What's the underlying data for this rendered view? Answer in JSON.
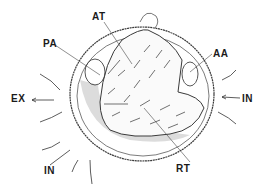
{
  "diagram": {
    "colors": {
      "line": "#3a3a3a",
      "shade": "#d8d8d8",
      "background": "#ffffff"
    },
    "labels": [
      {
        "id": "AT",
        "text": "AT",
        "x": 92,
        "y": 12
      },
      {
        "id": "PA",
        "text": "PA",
        "x": 43,
        "y": 39
      },
      {
        "id": "AA",
        "text": "AA",
        "x": 213,
        "y": 49
      },
      {
        "id": "EX",
        "text": "EX",
        "x": 11,
        "y": 94
      },
      {
        "id": "IN_right",
        "text": "IN",
        "x": 242,
        "y": 94
      },
      {
        "id": "IN_bottom",
        "text": "IN",
        "x": 44,
        "y": 166
      },
      {
        "id": "RT",
        "text": "RT",
        "x": 176,
        "y": 164
      }
    ]
  }
}
